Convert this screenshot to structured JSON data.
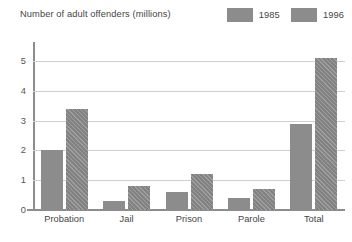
{
  "chart_data": {
    "type": "bar",
    "title": "Number of adult offenders (millions)",
    "xlabel": "",
    "ylabel": "",
    "ylim": [
      0,
      5.5
    ],
    "yticks": [
      0,
      1,
      2,
      3,
      4,
      5
    ],
    "ytick_labels": [
      "0",
      "1",
      "2",
      "3",
      "4",
      "5"
    ],
    "grid": true,
    "legend_position": "top-right",
    "categories": [
      "Probation",
      "Jail",
      "Prison",
      "Parole",
      "Total"
    ],
    "series": [
      {
        "name": "1985",
        "color": "#8c8c8c",
        "pattern": "solid",
        "values": [
          2.0,
          0.3,
          0.6,
          0.4,
          2.9
        ]
      },
      {
        "name": "1996",
        "color": "#8c8c8c",
        "pattern": "diagonal-hatch",
        "values": [
          3.4,
          0.8,
          1.2,
          0.7,
          5.1
        ]
      }
    ]
  },
  "legend": {
    "entries": [
      {
        "label": "1985",
        "swatch_name": "legend-swatch-1985"
      },
      {
        "label": "1996",
        "swatch_name": "legend-swatch-1996"
      }
    ]
  },
  "colors": {
    "bar": "#8c8c8c",
    "gridline": "#cfcfcf",
    "axis": "#8d8d8d",
    "text": "#454545",
    "background": "#ffffff"
  }
}
